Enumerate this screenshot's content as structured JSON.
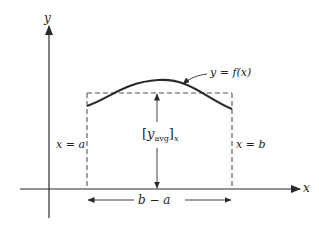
{
  "diagram": {
    "axes": {
      "x_label": "x",
      "y_label": "y"
    },
    "curve_label": "y = f(x)",
    "left_bound_label": "x = a",
    "right_bound_label": "x = b",
    "width_label": "b − a",
    "avg_label": {
      "open": "[",
      "var": "y",
      "sub": "avg",
      "close": "]",
      "subscript_outer": "x"
    },
    "colors": {
      "line": "#2a2a2a",
      "dashed": "#555555",
      "background": "#ffffff"
    }
  }
}
